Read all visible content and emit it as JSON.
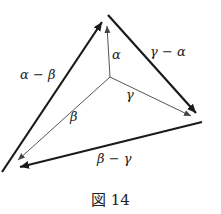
{
  "figure": {
    "caption": "図 14",
    "colors": {
      "ink": "#1a1a1a",
      "thin": "#555555",
      "background": "#ffffff"
    }
  },
  "vectors": {
    "alpha": {
      "label": "α",
      "from": [
        110,
        77
      ],
      "to": [
        107,
        26
      ]
    },
    "beta": {
      "label": "β",
      "from": [
        110,
        77
      ],
      "to": [
        18,
        160
      ]
    },
    "gamma": {
      "label": "γ",
      "from": [
        110,
        77
      ],
      "to": [
        191,
        116
      ]
    },
    "alpha_minus_beta": {
      "label": "α − β",
      "from": [
        2,
        172
      ],
      "to": [
        102,
        22
      ]
    },
    "gamma_minus_alpha": {
      "label": "γ − α",
      "from": [
        108,
        15
      ],
      "to": [
        196,
        113
      ]
    },
    "beta_minus_gamma": {
      "label": "β − γ",
      "from": [
        202,
        122
      ],
      "to": [
        20,
        167
      ]
    }
  }
}
